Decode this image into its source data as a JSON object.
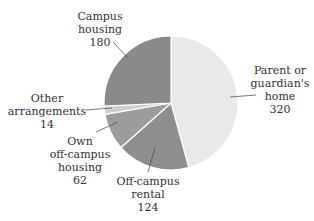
{
  "chart_data": {
    "type": "pie",
    "title": "",
    "start_angle": "12 o'clock, clockwise",
    "categories": [
      "Parent or guardian's home",
      "Off-campus rental",
      "Own off-campus housing",
      "Other arrangements",
      "Campus housing"
    ],
    "values": [
      320,
      124,
      62,
      14,
      180
    ],
    "colors": [
      "#e9e9e9",
      "#8e8e8e",
      "#9c9c9c",
      "#cfcfcf",
      "#8a8a8a"
    ],
    "total": 700
  },
  "labels": {
    "parent": {
      "line1": "Parent or",
      "line2": "guardian's",
      "line3": "home",
      "value": "320"
    },
    "rental": {
      "line1": "Off-campus",
      "line2": "rental",
      "value": "124"
    },
    "own": {
      "line1": "Own",
      "line2": "off-campus",
      "line3": "housing",
      "value": "62"
    },
    "other": {
      "line1": "Other",
      "line2": "arrangements",
      "value": "14"
    },
    "campus": {
      "line1": "Campus",
      "line2": "housing",
      "value": "180"
    }
  }
}
